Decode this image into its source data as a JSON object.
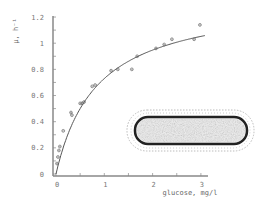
{
  "chart_data": {
    "type": "scatter",
    "title": "",
    "xlabel": "glucose, mg/l",
    "ylabel": "μ, h⁻¹",
    "xlim": [
      0,
      3.2
    ],
    "ylim": [
      0,
      1.2
    ],
    "x_ticks": [
      "0",
      "1",
      "2",
      "3"
    ],
    "y_ticks": [
      "0",
      "0.2",
      "0.4",
      "0.6",
      "0.8",
      "1",
      "1.2"
    ],
    "grid": false,
    "legend": null,
    "series": [
      {
        "name": "measured",
        "type": "scatter",
        "x": [
          0.02,
          0.04,
          0.06,
          0.08,
          0.15,
          0.31,
          0.33,
          0.5,
          0.54,
          0.58,
          0.75,
          0.81,
          1.14,
          1.28,
          1.57,
          1.68,
          2.07,
          2.24,
          2.4,
          2.86,
          2.98
        ],
        "y": [
          0.08,
          0.13,
          0.18,
          0.21,
          0.33,
          0.47,
          0.45,
          0.54,
          0.54,
          0.55,
          0.67,
          0.68,
          0.79,
          0.8,
          0.8,
          0.9,
          0.96,
          0.99,
          1.03,
          1.03,
          1.14
        ]
      },
      {
        "name": "fit",
        "type": "line",
        "model": "Monod",
        "mu_max": 1.35,
        "Ks": 0.85
      }
    ],
    "annotations": [
      "inset: rod-shaped bacterial cell"
    ]
  },
  "colors": {
    "axis": "#888888",
    "curve": "#555555",
    "points": "#666666",
    "cell": "#333333"
  }
}
